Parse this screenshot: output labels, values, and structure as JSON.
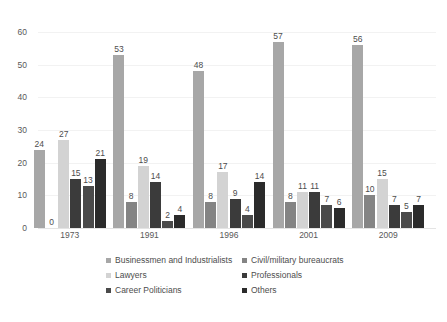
{
  "chart_data": {
    "type": "bar",
    "title": "",
    "subtitle": "",
    "xlabel": "",
    "ylabel": "",
    "ylim": [
      0,
      60
    ],
    "yticks": [
      0,
      10,
      20,
      30,
      40,
      50,
      60
    ],
    "grid": true,
    "legend_position": "bottom",
    "categories": [
      "1973",
      "1991",
      "1996",
      "2001",
      "2009"
    ],
    "series": [
      {
        "name": "Businessmen and Industrialists",
        "color": "#a7a7a7",
        "values": [
          24,
          53,
          48,
          57,
          56
        ]
      },
      {
        "name": "Civil/military bureaucrats",
        "color": "#848484",
        "values": [
          0,
          8,
          8,
          8,
          10
        ]
      },
      {
        "name": "Lawyers",
        "color": "#d3d3d3",
        "values": [
          27,
          19,
          17,
          11,
          15
        ]
      },
      {
        "name": "Professionals",
        "color": "#3b3b3b",
        "values": [
          15,
          14,
          9,
          11,
          7
        ]
      },
      {
        "name": "Career Politicians",
        "color": "#4a4a4a",
        "values": [
          13,
          2,
          4,
          7,
          5
        ]
      },
      {
        "name": "Others",
        "color": "#2b2b2b",
        "values": [
          21,
          4,
          14,
          6,
          7
        ]
      }
    ],
    "data_labels": {
      "1973": [
        "24",
        "0",
        "27",
        "15",
        "13",
        "21"
      ],
      "1991": [
        "53",
        "8",
        "19",
        "14",
        "2",
        "4"
      ],
      "1996": [
        "48",
        "8",
        "17",
        "9",
        "4",
        "14"
      ],
      "2001": [
        "57",
        "8",
        "11",
        "11",
        "7",
        "6"
      ],
      "2009": [
        "56",
        "10",
        "15",
        "7",
        "5",
        "7"
      ]
    }
  },
  "legend": {
    "items": [
      {
        "label": "Businessmen and Industrialists",
        "color": "#a7a7a7"
      },
      {
        "label": "Civil/military bureaucrats",
        "color": "#848484"
      },
      {
        "label": "Lawyers",
        "color": "#d3d3d3"
      },
      {
        "label": "Professionals",
        "color": "#3b3b3b"
      },
      {
        "label": "Career Politicians",
        "color": "#4a4a4a"
      },
      {
        "label": "Others",
        "color": "#2b2b2b"
      }
    ]
  }
}
